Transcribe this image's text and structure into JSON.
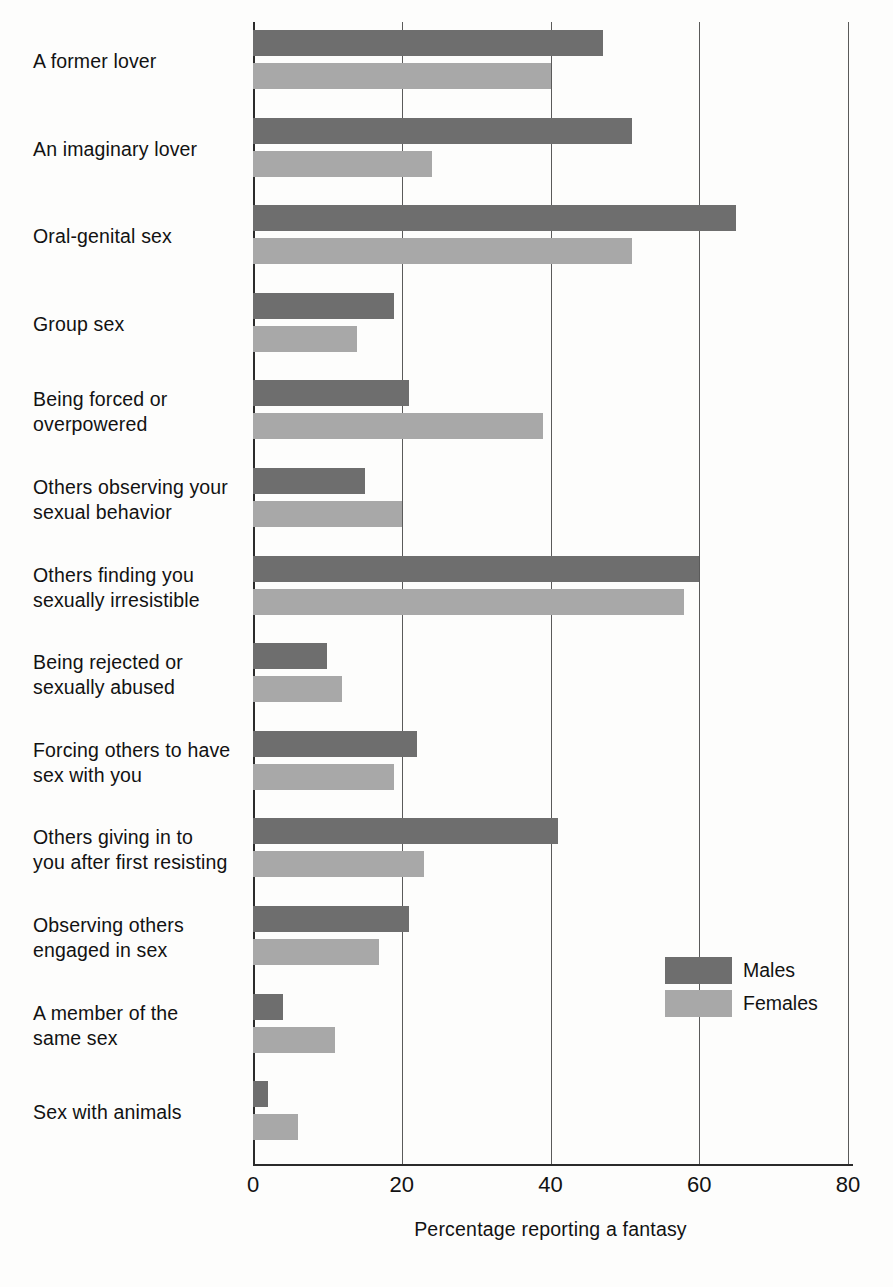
{
  "chart_data": {
    "type": "bar",
    "orientation": "horizontal",
    "title": "",
    "xlabel": "Percentage reporting a fantasy",
    "ylabel": "",
    "xlim": [
      0,
      80
    ],
    "xticks": [
      0,
      20,
      40,
      60,
      80
    ],
    "xtick_labels": [
      "0",
      "20",
      "40",
      "60",
      "80"
    ],
    "grid": true,
    "grid_axis": "x",
    "legend_position": "inner-right",
    "categories": [
      "A former lover",
      "An imaginary lover",
      "Oral-genital sex",
      "Group sex",
      "Being forced or overpowered",
      "Others observing your sexual behavior",
      "Others finding you sexually irresistible",
      "Being rejected or sexually abused",
      "Forcing others to have sex with you",
      "Others giving in to you after first resisting",
      "Observing others engaged in sex",
      "A member of the same sex",
      "Sex with animals"
    ],
    "category_lines": [
      [
        "A former lover"
      ],
      [
        "An imaginary lover"
      ],
      [
        "Oral-genital sex"
      ],
      [
        "Group sex"
      ],
      [
        "Being forced or",
        "overpowered"
      ],
      [
        "Others observing your",
        "sexual behavior"
      ],
      [
        "Others finding you",
        "sexually irresistible"
      ],
      [
        "Being rejected or",
        "sexually abused"
      ],
      [
        "Forcing others to have",
        "sex with you"
      ],
      [
        "Others giving in to",
        "you after first resisting"
      ],
      [
        "Observing others",
        "engaged in sex"
      ],
      [
        "A member of the",
        "same sex"
      ],
      [
        "Sex with animals"
      ]
    ],
    "series": [
      {
        "name": "Males",
        "color": "#6e6e6e",
        "values": [
          47,
          51,
          65,
          19,
          21,
          15,
          60,
          10,
          22,
          41,
          21,
          4,
          2
        ]
      },
      {
        "name": "Females",
        "color": "#a8a8a8",
        "values": [
          40,
          24,
          51,
          14,
          39,
          20,
          58,
          12,
          19,
          23,
          17,
          11,
          6
        ]
      }
    ]
  },
  "legend": {
    "items": [
      {
        "label": "Males",
        "color": "#6e6e6e"
      },
      {
        "label": "Females",
        "color": "#a8a8a8"
      }
    ]
  },
  "axis": {
    "x_title": "Percentage reporting a fantasy",
    "tick_labels": [
      "0",
      "20",
      "40",
      "60",
      "80"
    ]
  }
}
